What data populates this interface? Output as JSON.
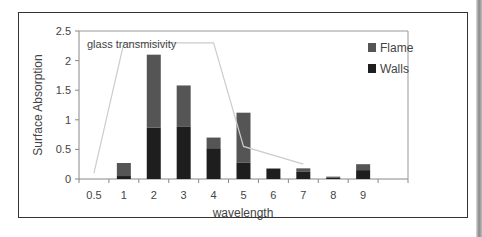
{
  "chart_data": {
    "type": "bar",
    "stacked": true,
    "title": "",
    "xlabel": "wavelength",
    "ylabel": "Surface Absorption",
    "ylim": [
      0,
      2.5
    ],
    "yticks": [
      "0",
      "0.5",
      "1",
      "1.5",
      "2",
      "2.5"
    ],
    "categories": [
      "0.5",
      "1",
      "2",
      "3",
      "4",
      "5",
      "6",
      "7",
      "8",
      "9",
      ""
    ],
    "series": [
      {
        "name": "Walls",
        "color": "#1e1e1e",
        "values": [
          0,
          0.05,
          0.87,
          0.88,
          0.52,
          0.28,
          0.17,
          0.12,
          0.02,
          0.15,
          0
        ]
      },
      {
        "name": "Flame",
        "color": "#555555",
        "values": [
          0,
          0.22,
          1.23,
          0.7,
          0.18,
          0.84,
          0.01,
          0.06,
          0.02,
          0.1,
          0
        ]
      }
    ],
    "line": {
      "name": "glass transmisivity",
      "color": "#cccccc",
      "x_index": [
        0.5,
        1.0,
        4.0,
        5.0,
        7.0
      ],
      "values": [
        0.1,
        2.3,
        2.3,
        0.55,
        0.25
      ]
    },
    "annotation": "glass transmisivity",
    "legend": {
      "position": "top-right",
      "entries": [
        "Flame",
        "Walls"
      ]
    },
    "grid": false
  }
}
